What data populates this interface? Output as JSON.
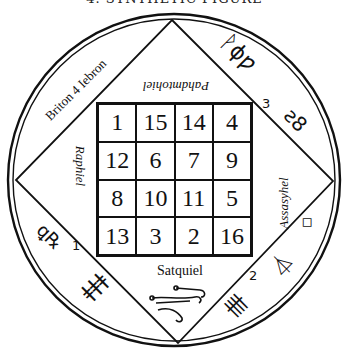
{
  "title": "4. SYNTHETIC FIGURE",
  "seal": {
    "labels": {
      "top": "Pahdmtohiel",
      "left": "Raphiel",
      "right": "Assasyhel",
      "bottom": "Satquiel",
      "upper_left": "Briton 4 Iebron"
    },
    "magic_square": [
      [
        "1",
        "15",
        "14",
        "4"
      ],
      [
        "12",
        "6",
        "7",
        "9"
      ],
      [
        "8",
        "10",
        "11",
        "5"
      ],
      [
        "13",
        "3",
        "2",
        "16"
      ]
    ],
    "symbols": {
      "upper_right_a": "ᚹϕƿ",
      "upper_right_num": "3",
      "upper_right_b": "ƨ8",
      "lower_left_a": "ꝗ℞",
      "lower_left_num": "1",
      "lower_left_b": "ǂǂǂ",
      "lower_right_a": "⏃",
      "lower_right_b": "◇",
      "lower_right_num": "2",
      "lower_right_c": "卌"
    }
  }
}
